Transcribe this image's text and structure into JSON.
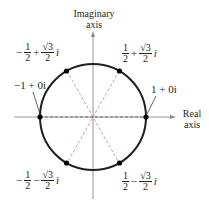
{
  "diagram": {
    "type": "complex-plane-unit-circle",
    "axes": {
      "imaginary_label_line1": "Imaginary",
      "imaginary_label_line2": "axis",
      "real_label_line1": "Real",
      "real_label_line2": "axis"
    },
    "points": [
      {
        "id": "p0",
        "label": "1 + 0i",
        "real": "1",
        "imag": "0"
      },
      {
        "id": "p1",
        "sign_re": "",
        "num_re": "1",
        "den_re": "2",
        "op": "+",
        "num_im": "√3",
        "den_im": "2",
        "unit": "i"
      },
      {
        "id": "p2",
        "sign_re": "−",
        "num_re": "1",
        "den_re": "2",
        "op": "+",
        "num_im": "√3",
        "den_im": "2",
        "unit": "i"
      },
      {
        "id": "p3",
        "label": "−1 + 0i",
        "real": "−1",
        "imag": "0"
      },
      {
        "id": "p4",
        "sign_re": "−",
        "num_re": "1",
        "den_re": "2",
        "op": "−",
        "num_im": "√3",
        "den_im": "2",
        "unit": "i"
      },
      {
        "id": "p5",
        "sign_re": "",
        "num_re": "1",
        "den_re": "2",
        "op": "−",
        "num_im": "√3",
        "den_im": "2",
        "unit": "i"
      }
    ],
    "colors": {
      "circle": "#231f20",
      "axes": "#8a8a8a",
      "dashed_lines": "#d08080",
      "points": "#000000"
    }
  }
}
